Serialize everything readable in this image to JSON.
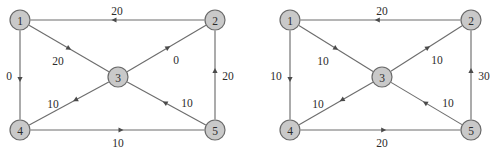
{
  "figure": {
    "type": "two-panel-directed-graph",
    "panel_count": 2,
    "node_fill_color": "#c9c9c9",
    "node_stroke_color": "#6a6a6a",
    "edge_color": "#6d6d6d",
    "label_color": "#2b2b2b"
  },
  "panels": [
    {
      "id": "left",
      "nodes": [
        {
          "id": "1",
          "label": "1",
          "cx": 20,
          "cy": 20,
          "r": 10
        },
        {
          "id": "2",
          "label": "2",
          "cx": 215,
          "cy": 20,
          "r": 10
        },
        {
          "id": "3",
          "label": "3",
          "cx": 118,
          "cy": 77,
          "r": 10
        },
        {
          "id": "4",
          "label": "4",
          "cx": 20,
          "cy": 130,
          "r": 10
        },
        {
          "id": "5",
          "label": "5",
          "cx": 215,
          "cy": 130,
          "r": 10
        }
      ],
      "edges": [
        {
          "name": "edge-2-1",
          "from": "2",
          "to": "1",
          "label": "20",
          "label_x": 117,
          "label_y": 11,
          "arrow_t": 0.52
        },
        {
          "name": "edge-1-4",
          "from": "1",
          "to": "4",
          "label": "0",
          "label_x": 9,
          "label_y": 76,
          "arrow_t": 0.55
        },
        {
          "name": "edge-5-2",
          "from": "5",
          "to": "2",
          "label": "20",
          "label_x": 228,
          "label_y": 76,
          "arrow_t": 0.55
        },
        {
          "name": "edge-4-5",
          "from": "4",
          "to": "5",
          "label": "10",
          "label_x": 118,
          "label_y": 143,
          "arrow_t": 0.52
        },
        {
          "name": "edge-1-3",
          "from": "1",
          "to": "3",
          "label": "20",
          "label_x": 58,
          "label_y": 61,
          "arrow_t": 0.5
        },
        {
          "name": "edge-3-2",
          "from": "3",
          "to": "2",
          "label": "0",
          "label_x": 176,
          "label_y": 60,
          "arrow_t": 0.52
        },
        {
          "name": "edge-3-4",
          "from": "3",
          "to": "4",
          "label": "10",
          "label_x": 53,
          "label_y": 104,
          "arrow_t": 0.42
        },
        {
          "name": "edge-5-3",
          "from": "5",
          "to": "3",
          "label": "10",
          "label_x": 187,
          "label_y": 103,
          "arrow_t": 0.52
        }
      ]
    },
    {
      "id": "right",
      "nodes": [
        {
          "id": "1",
          "label": "1",
          "cx": 45,
          "cy": 20,
          "r": 10
        },
        {
          "id": "2",
          "label": "2",
          "cx": 226,
          "cy": 20,
          "r": 10
        },
        {
          "id": "3",
          "label": "3",
          "cx": 137,
          "cy": 77,
          "r": 10
        },
        {
          "id": "4",
          "label": "4",
          "cx": 45,
          "cy": 130,
          "r": 10
        },
        {
          "id": "5",
          "label": "5",
          "cx": 226,
          "cy": 130,
          "r": 10
        }
      ],
      "edges": [
        {
          "name": "edge-2-1",
          "from": "2",
          "to": "1",
          "label": "20",
          "label_x": 137,
          "label_y": 11,
          "arrow_t": 0.52
        },
        {
          "name": "edge-1-4",
          "from": "1",
          "to": "4",
          "label": "10",
          "label_x": 31,
          "label_y": 76,
          "arrow_t": 0.55
        },
        {
          "name": "edge-5-2",
          "from": "5",
          "to": "2",
          "label": "30",
          "label_x": 239,
          "label_y": 76,
          "arrow_t": 0.55
        },
        {
          "name": "edge-4-5",
          "from": "4",
          "to": "5",
          "label": "20",
          "label_x": 137,
          "label_y": 143,
          "arrow_t": 0.52
        },
        {
          "name": "edge-1-3",
          "from": "1",
          "to": "3",
          "label": "10",
          "label_x": 78,
          "label_y": 61,
          "arrow_t": 0.5
        },
        {
          "name": "edge-3-2",
          "from": "3",
          "to": "2",
          "label": "10",
          "label_x": 192,
          "label_y": 60,
          "arrow_t": 0.52
        },
        {
          "name": "edge-3-4",
          "from": "3",
          "to": "4",
          "label": "10",
          "label_x": 73,
          "label_y": 104,
          "arrow_t": 0.42
        },
        {
          "name": "edge-5-3",
          "from": "5",
          "to": "3",
          "label": "10",
          "label_x": 203,
          "label_y": 103,
          "arrow_t": 0.52
        }
      ]
    }
  ]
}
